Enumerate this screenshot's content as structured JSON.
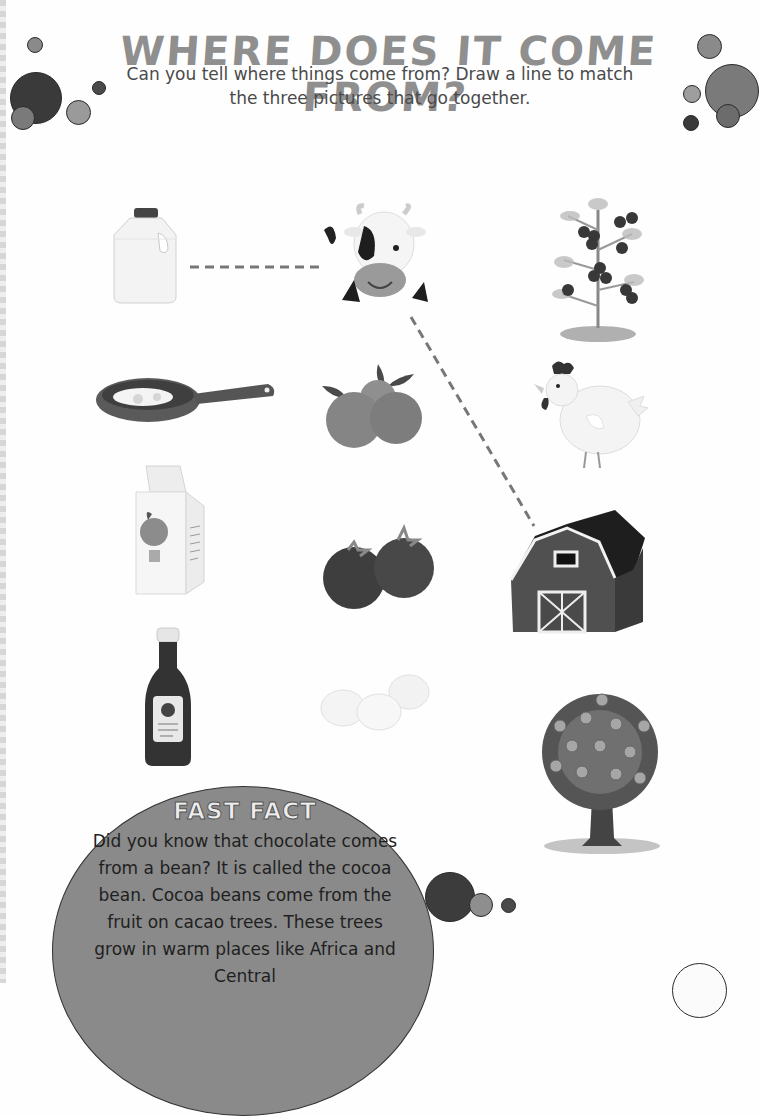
{
  "header": {
    "title": "WHERE DOES IT COME FROM?",
    "instructions": "Can you tell where things come from? Draw a line to match the three pictures that go together."
  },
  "columns": {
    "left": [
      {
        "name": "milk-jug",
        "label": "Milk jug"
      },
      {
        "name": "frying-pan-eggs",
        "label": "Frying pan with eggs"
      },
      {
        "name": "juice-carton",
        "label": "Orange juice carton"
      },
      {
        "name": "ketchup-bottle",
        "label": "Ketchup bottle"
      }
    ],
    "middle": [
      {
        "name": "cow",
        "label": "Cow"
      },
      {
        "name": "oranges",
        "label": "Oranges"
      },
      {
        "name": "tomatoes",
        "label": "Tomatoes"
      },
      {
        "name": "eggs",
        "label": "Eggs"
      }
    ],
    "right": [
      {
        "name": "tomato-plant",
        "label": "Tomato plant"
      },
      {
        "name": "chicken",
        "label": "Chicken"
      },
      {
        "name": "barn",
        "label": "Barn"
      },
      {
        "name": "orange-tree",
        "label": "Orange tree"
      }
    ]
  },
  "example_match": {
    "lines": [
      {
        "from": "milk-jug",
        "to": "cow"
      },
      {
        "from": "cow",
        "to": "barn"
      }
    ]
  },
  "fast_fact": {
    "title": "FAST FACT",
    "text": "Did you know that chocolate comes from a bean? It is called the cocoa bean. Cocoa beans come from the fruit on cacao trees. These trees grow in warm places like Africa and Central"
  },
  "colors": {
    "title": "#8f8f8f",
    "bubble_dark": "#3c3c3c",
    "bubble_mid": "#7a7a7a",
    "bubble_light": "#9a9a9a",
    "fact_bg": "#8a8a8a",
    "dash_line": "#777777"
  }
}
